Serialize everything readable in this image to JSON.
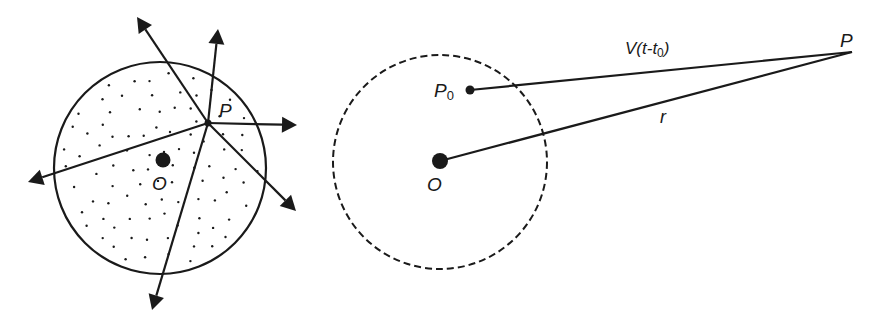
{
  "colors": {
    "ink": "#1a1a1a",
    "background": "#ffffff"
  },
  "left_figure": {
    "description": "Solid circle with stippled interior; rays emanate from point P in all directions",
    "circle": {
      "cx": 160,
      "cy": 168,
      "r": 106,
      "style": "solid",
      "fill": "stippled"
    },
    "point_P": {
      "label": "P",
      "x": 208,
      "y": 123
    },
    "point_O": {
      "label": "O",
      "x": 163,
      "y": 160
    },
    "rays": [
      {
        "to": [
          137,
          17
        ]
      },
      {
        "to": [
          218,
          29
        ]
      },
      {
        "to": [
          297,
          125
        ]
      },
      {
        "to": [
          296,
          211
        ]
      },
      {
        "to": [
          152,
          310
        ]
      },
      {
        "to": [
          28,
          182
        ]
      }
    ]
  },
  "right_figure": {
    "description": "Dashed circle centered at O; segment from P0 to distant point P labeled V(t-t0); segment from O to P labeled r",
    "circle": {
      "cx": 440,
      "cy": 162,
      "r": 107,
      "style": "dashed"
    },
    "point_O": {
      "label": "O",
      "x": 440,
      "y": 161
    },
    "point_P0": {
      "label_main": "P",
      "label_sub": "0",
      "x": 470,
      "y": 90
    },
    "point_P": {
      "label": "P",
      "x": 852,
      "y": 52
    },
    "segment_P0_P": {
      "label_main": "V(t-t",
      "label_sub": "0",
      "label_end": ")"
    },
    "segment_O_P": {
      "label": "r"
    }
  }
}
